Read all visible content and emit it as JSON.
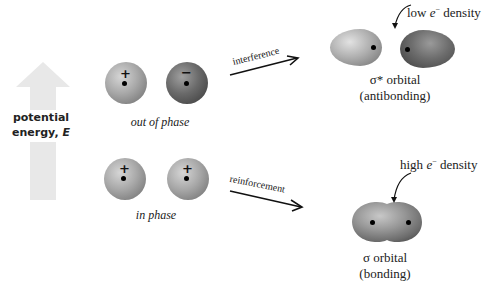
{
  "axis": {
    "label_line1": "potential",
    "label_line2": "energy,",
    "label_symbol": "E",
    "arrow_color": "#e6e6e6"
  },
  "top_row": {
    "left_sign": "+",
    "right_sign": "−",
    "caption": "out of phase",
    "left_color": "#9a9a9a",
    "right_color": "#5a5a5a"
  },
  "bottom_row": {
    "left_sign": "+",
    "right_sign": "+",
    "caption": "in phase",
    "color": "#9a9a9a"
  },
  "arrows": {
    "top_label": "interference",
    "bottom_label": "reinforcement"
  },
  "antibonding": {
    "density_prefix": "low",
    "density_symbol": "e",
    "density_sup": "−",
    "density_suffix": "density",
    "name": "σ* orbital",
    "type": "(antibonding)"
  },
  "bonding": {
    "density_prefix": "high",
    "density_symbol": "e",
    "density_sup": "−",
    "density_suffix": "density",
    "name": "σ orbital",
    "type": "(bonding)"
  }
}
